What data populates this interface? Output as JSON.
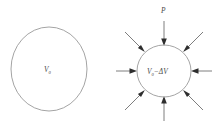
{
  "figure": {
    "background_color": "#ffffff",
    "outline_color": "#9a9a9a",
    "arrow_color": "#2e2e2e",
    "label_color": "#4a4a4a"
  },
  "panels": [
    {
      "id": "uncompressed",
      "name": "uncompressed-sphere",
      "center": {
        "x": 49,
        "y": 69
      },
      "radius_x": 38,
      "radius_y": 42,
      "label": {
        "base": "V",
        "subscript": "0",
        "suffix": "",
        "full_text": "V0"
      },
      "arrow_count": 0
    },
    {
      "id": "compressed",
      "name": "compressed-sphere",
      "center": {
        "x": 164,
        "y": 71
      },
      "radius_x": 27,
      "radius_y": 26,
      "label": {
        "base": "V",
        "subscript": "0",
        "suffix": "−ΔV",
        "full_text": "V0−ΔV"
      },
      "pressure_label": "P",
      "arrow_count": 8,
      "arrow_angles_deg": [
        90,
        135,
        180,
        225,
        270,
        315,
        0,
        45
      ],
      "arrow_direction": "inward",
      "arrow_length": 24
    }
  ],
  "labels": {
    "left_volume": "V",
    "left_volume_subscript": "0",
    "right_volume": "V",
    "right_volume_subscript": "0",
    "right_volume_delta": "−ΔV",
    "pressure": "P"
  }
}
